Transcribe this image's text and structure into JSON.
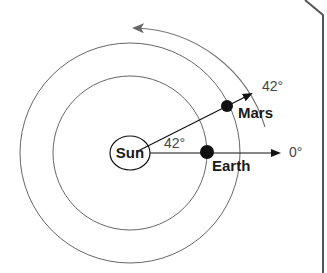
{
  "diagram": {
    "type": "orbital-geometry",
    "bodies": {
      "sun": {
        "label": "Sun"
      },
      "earth": {
        "label": "Earth"
      },
      "mars": {
        "label": "Mars"
      }
    },
    "angles": {
      "reference": "0°",
      "mars_direction": "42°",
      "sun_angle": "42°"
    },
    "colors": {
      "line": "#111111",
      "orbit": "#666666",
      "motion_arc": "#777777",
      "planet": "#111111",
      "border": "#555555"
    }
  }
}
